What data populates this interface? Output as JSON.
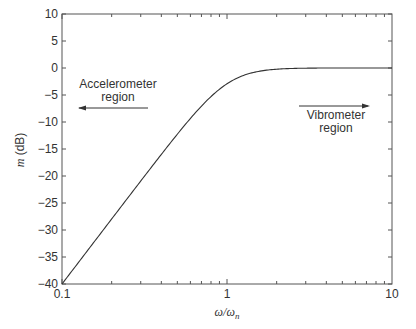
{
  "chart_data": {
    "type": "line",
    "title": "",
    "xlabel": "ω/ω_n",
    "ylabel": "m (dB)",
    "xscale": "log",
    "xlim": [
      0.1,
      10
    ],
    "ylim": [
      -40,
      10
    ],
    "xticks": [
      0.1,
      1,
      10
    ],
    "xtick_labels": [
      "0.1",
      "1",
      "10"
    ],
    "yticks": [
      10,
      5,
      0,
      -5,
      -10,
      -15,
      -20,
      -25,
      -30,
      -35,
      -40
    ],
    "ytick_labels": [
      "10",
      "5",
      "0",
      "−5",
      "−10",
      "−15",
      "−20",
      "−25",
      "−30",
      "−35",
      "−40"
    ],
    "grid": false,
    "legend": null,
    "series": [
      {
        "name": "m",
        "damping_ratio_estimate": 0.7,
        "x": [
          0.1,
          0.2,
          0.3,
          0.5,
          0.7,
          1.0,
          1.5,
          2.0,
          3.0,
          5.0,
          10.0
        ],
        "values": [
          -40.0,
          -28.0,
          -21.0,
          -12.4,
          -7.2,
          -3.0,
          -0.7,
          -0.2,
          0.0,
          0.1,
          0.3
        ]
      }
    ],
    "annotations": [
      {
        "text": "Accelerometer\nregion",
        "line1": "Accelerometer",
        "line2": "region",
        "arrow": "left",
        "x_range": [
          0.12,
          0.5
        ],
        "y": -5.5
      },
      {
        "text": "Vibrometer\nregion",
        "line1": "Vibrometer",
        "line2": "region",
        "arrow": "right",
        "x_range": [
          2.9,
          8.5
        ],
        "y": -6
      }
    ]
  },
  "labels": {
    "xlabel_main": "ω/ω",
    "xlabel_sub": "n",
    "ylabel_main": "m",
    "ylabel_unit": " (dB)",
    "accel_line1": "Accelerometer",
    "accel_line2": "region",
    "vibro_line1": "Vibrometer",
    "vibro_line2": "region"
  },
  "colors": {
    "axis": "#555555",
    "curve": "#333333",
    "text": "#333333"
  }
}
